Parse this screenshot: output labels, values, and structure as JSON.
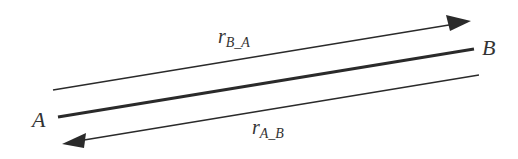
{
  "diagram": {
    "nodes": [
      {
        "id": "A",
        "label": "A"
      },
      {
        "id": "B",
        "label": "B"
      }
    ],
    "edges": [
      {
        "id": "r_B_A",
        "label_main": "r",
        "label_sub": "B_A",
        "direction": "A→B (arrow toward B)",
        "position": "above"
      },
      {
        "id": "link",
        "label_main": "",
        "label_sub": "",
        "direction": "none",
        "style": "thick"
      },
      {
        "id": "r_A_B",
        "label_main": "r",
        "label_sub": "A_B",
        "direction": "B→A (arrow toward A)",
        "position": "below"
      }
    ],
    "colors": {
      "line": "#2a2a2a",
      "text": "#333333",
      "background": "#ffffff"
    }
  }
}
